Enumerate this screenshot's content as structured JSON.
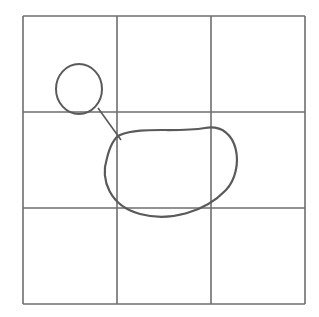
{
  "diagram": {
    "background": "#ffffff",
    "stroke_color": "#6e6e6e",
    "shape_color": "#5a5a5a",
    "grid": {
      "rows": 3,
      "cols": 3,
      "x_lines": [
        23,
        117,
        211,
        305
      ],
      "y_lines": [
        16,
        112,
        208,
        304
      ]
    },
    "small_circle": {
      "cx": 79,
      "cy": 89,
      "rx": 23,
      "ry": 25
    },
    "connector": {
      "x1": 98,
      "y1": 108,
      "x2": 121,
      "y2": 140
    },
    "large_blob": {
      "path": "M 120 135 C 140 126, 175 133, 205 128 C 240 122, 245 170, 226 190 C 205 212, 170 222, 140 214 C 110 206, 100 180, 107 158 C 110 146, 114 138, 120 135 Z"
    }
  }
}
